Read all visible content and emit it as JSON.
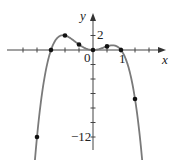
{
  "chart_data": {
    "type": "line",
    "title": "",
    "xlabel": "x",
    "ylabel": "y",
    "function": "f(x) = -x^2(2x+3)(x-1)",
    "xlim": [
      -3,
      2
    ],
    "ylim": [
      -13.5,
      3
    ],
    "grid": false,
    "x_tick_step": 0.5,
    "y_tick_step": 2,
    "x_tick_labels": [
      {
        "value": 1,
        "text": "1"
      }
    ],
    "y_tick_labels": [
      {
        "value": 2,
        "text": "2"
      },
      {
        "value": -12,
        "text": "−12"
      }
    ],
    "origin_label": "0",
    "marked_points": [
      {
        "x": -2,
        "y": -12
      },
      {
        "x": -1.5,
        "y": 0
      },
      {
        "x": -1,
        "y": 2
      },
      {
        "x": -0.5,
        "y": 0.75
      },
      {
        "x": 0,
        "y": 0
      },
      {
        "x": 0.5,
        "y": 0.5
      },
      {
        "x": 1,
        "y": 0
      },
      {
        "x": 1.5,
        "y": -6.75
      }
    ],
    "curve_color": "#7a7a7a",
    "point_color": "#111111"
  },
  "labels": {
    "x_axis": "x",
    "y_axis": "y",
    "origin": "0",
    "x_one": "1",
    "y_two": "2",
    "y_minus_twelve": "−12"
  }
}
